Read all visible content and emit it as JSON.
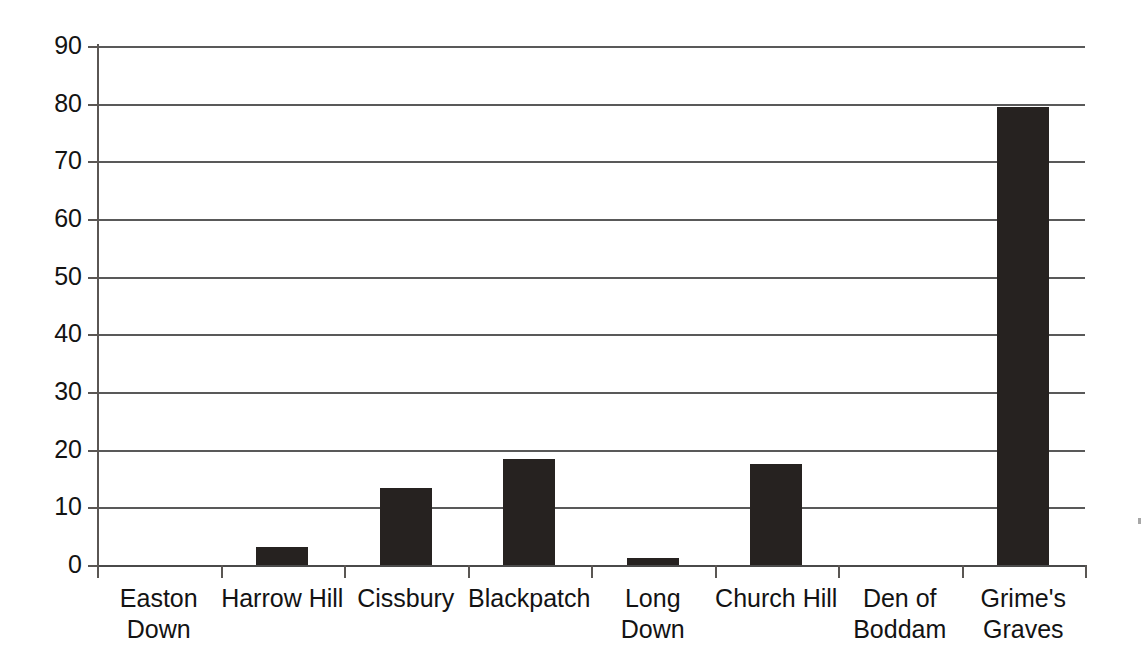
{
  "chart_data": {
    "type": "bar",
    "title": "",
    "subtitle": "",
    "xlabel": "",
    "ylabel": "",
    "categories": [
      "Easton Down",
      "Harrow Hill",
      "Cissbury",
      "Blackpatch",
      "Long Down",
      "Church Hill",
      "Den of Boddam",
      "Grime's Graves"
    ],
    "category_lines": [
      [
        "Easton",
        "Down"
      ],
      [
        "Harrow Hill"
      ],
      [
        "Cissbury"
      ],
      [
        "Blackpatch"
      ],
      [
        "Long Down"
      ],
      [
        "Church Hill"
      ],
      [
        "Den of",
        "Boddam"
      ],
      [
        "Grime's",
        "Graves"
      ]
    ],
    "values": [
      0,
      3.1,
      13.3,
      18.4,
      1.3,
      17.5,
      0,
      79.5
    ],
    "ylim": [
      0,
      90
    ],
    "ytick_labels": [
      "90",
      "80",
      "70",
      "60",
      "50",
      "40",
      "30",
      "20",
      "10",
      "0"
    ],
    "ytick_values": [
      90,
      80,
      70,
      60,
      50,
      40,
      30,
      20,
      10,
      0
    ],
    "ystep": 10,
    "grid": "horizontal",
    "legend": "none",
    "bar_color": "#262220",
    "grid_color": "#595959",
    "axis_color": "#5a5653",
    "background_color": "#ffffff",
    "text_color": "#131313"
  }
}
